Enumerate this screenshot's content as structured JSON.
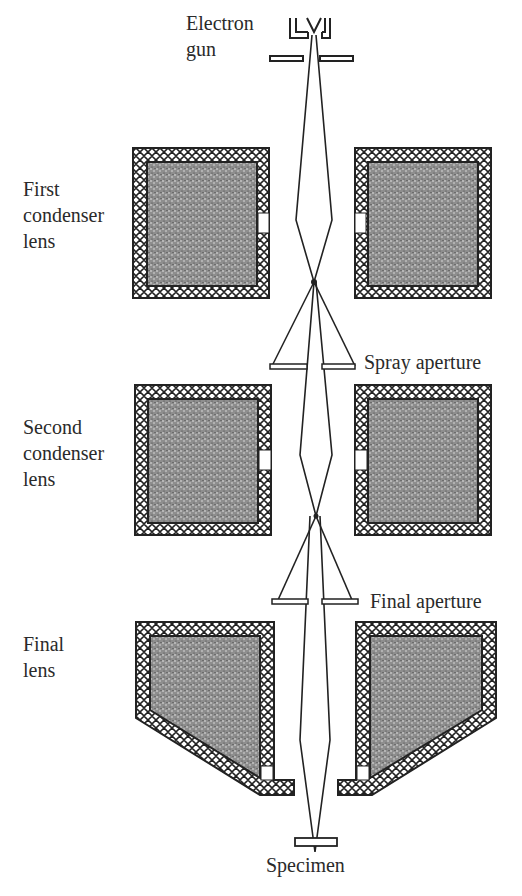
{
  "diagram": {
    "labels": {
      "electron_gun": "Electron\ngun",
      "first_condenser": "First\ncondenser\nlens",
      "spray_aperture": "Spray aperture",
      "second_condenser": "Second\ncondenser\nlens",
      "final_aperture": "Final aperture",
      "final_lens": "Final\nlens",
      "specimen": "Specimen"
    },
    "colors": {
      "ink": "#222222",
      "coil_fill": "#9a9a9a",
      "background": "#ffffff"
    }
  }
}
